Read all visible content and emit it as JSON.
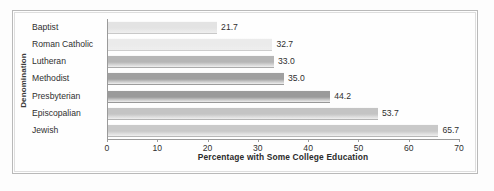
{
  "chart_data": {
    "type": "bar",
    "orientation": "horizontal",
    "title": "",
    "xlabel": "Percentage with Some College Education",
    "ylabel": "Denomination",
    "categories": [
      "Baptist",
      "Roman Catholic",
      "Lutheran",
      "Methodist",
      "Presbyterian",
      "Episcopalian",
      "Jewish"
    ],
    "values": [
      21.7,
      32.7,
      33.0,
      35.0,
      44.2,
      53.7,
      65.7
    ],
    "value_labels": [
      "21.7",
      "32.7",
      "33.0",
      "35.0",
      "44.2",
      "53.7",
      "65.7"
    ],
    "bar_colors": [
      "#e3e3e3",
      "#ebebeb",
      "#b6b6b6",
      "#a0a0a0",
      "#9a9a9a",
      "#c4c4c4",
      "#c9c9c9"
    ],
    "xlim": [
      0,
      70
    ],
    "xticks": [
      0,
      10,
      20,
      30,
      40,
      50,
      60,
      70
    ],
    "xtick_labels": [
      "0",
      "10",
      "20",
      "30",
      "40",
      "50",
      "60",
      "70"
    ],
    "grid": false,
    "legend": false
  },
  "figure": {
    "axis_color": "#9a9a9a",
    "frame_color": "#b9b9b9",
    "background": "#fdfdfd"
  }
}
